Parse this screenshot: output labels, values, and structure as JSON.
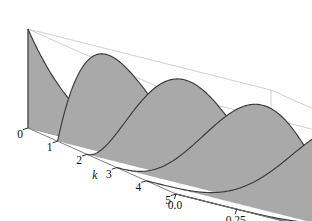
{
  "figure": {
    "title": "",
    "background_color": "#ffffff"
  },
  "chart_data": {
    "type": "area",
    "title": "",
    "xlabel": "θ",
    "ylabel": "k",
    "zlabel": "",
    "xlim": [
      0.0,
      1.0
    ],
    "ylim": [
      0,
      5
    ],
    "zlim": [
      0.0,
      1.0
    ],
    "grid": false,
    "legend": "none",
    "n": 5,
    "theta_ticks": [
      "0.0",
      "0.25",
      "0.50",
      "0.75",
      "1.0"
    ],
    "theta_tick_values": [
      0.0,
      0.25,
      0.5,
      0.75,
      1.0
    ],
    "k_ticks": [
      "0",
      "1",
      "2",
      "3",
      "4",
      "5"
    ],
    "k_tick_values": [
      0,
      1,
      2,
      3,
      4,
      5
    ],
    "z_ticks": [
      "1.0",
      "0.75",
      "0.50",
      "0.25",
      "0"
    ],
    "z_tick_values": [
      1.0,
      0.75,
      0.5,
      0.25,
      0.0
    ],
    "series": [
      {
        "name": "k = 0",
        "k": 0,
        "peak_theta": 0.0,
        "peak_value": 1.0
      },
      {
        "name": "k = 1",
        "k": 1,
        "peak_theta": 0.2,
        "peak_value": 1.0
      },
      {
        "name": "k = 2",
        "k": 2,
        "peak_theta": 0.4,
        "peak_value": 1.0
      },
      {
        "name": "k = 3",
        "k": 3,
        "peak_theta": 0.6,
        "peak_value": 1.0
      },
      {
        "name": "k = 4",
        "k": 4,
        "peak_theta": 0.8,
        "peak_value": 1.0
      },
      {
        "name": "k = 5",
        "k": 5,
        "peak_theta": 1.0,
        "peak_value": 1.0
      }
    ],
    "colors": {
      "surface_fill": "#a9a9a9",
      "surface_edge": "#3a3a3a",
      "box_front": "#6e6e6e",
      "box_back": "#c4c4c4",
      "tick_color": "#1a1a1a",
      "text_color": "#111111"
    }
  },
  "axes": {
    "theta_label": "θ",
    "k_label": "k"
  }
}
